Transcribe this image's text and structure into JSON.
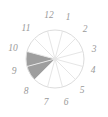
{
  "chart_data": {
    "type": "pie",
    "title": "",
    "subtitle": "",
    "xlabel": "",
    "ylabel": "",
    "legend_position": "none",
    "grid": false,
    "sector_count": 12,
    "sector_span_degrees": 30,
    "categories": [
      "1",
      "2",
      "3",
      "4",
      "5",
      "6",
      "7",
      "8",
      "9",
      "10",
      "11",
      "12"
    ],
    "values": [
      0,
      0,
      0,
      0,
      0,
      0,
      0,
      1,
      1,
      0,
      0,
      0
    ],
    "highlighted_sectors": [
      "8",
      "9"
    ],
    "shaded_arc_clock_range": "7:30 to 9:00",
    "shaded_arc_degrees": [
      240,
      300
    ],
    "colors": {
      "fill_shaded": "#9e9e9e",
      "fill_unshaded": "#ffffff",
      "outline": "#dcdcdc",
      "divider": "#e6e6e6",
      "label_text": "#9a9a9a",
      "background": "#ffffff"
    },
    "labels": [
      {
        "text": "12",
        "angle_deg": 90,
        "x": 49,
        "y": 16
      },
      {
        "text": "1",
        "angle_deg": 60,
        "x": 68,
        "y": 18
      },
      {
        "text": "2",
        "angle_deg": 30,
        "x": 85,
        "y": 30
      },
      {
        "text": "3",
        "angle_deg": 0,
        "x": 94,
        "y": 50
      },
      {
        "text": "4",
        "angle_deg": -30,
        "x": 93,
        "y": 71
      },
      {
        "text": "5",
        "angle_deg": -60,
        "x": 82,
        "y": 91
      },
      {
        "text": "6",
        "angle_deg": -90,
        "x": 66,
        "y": 103
      },
      {
        "text": "7",
        "angle_deg": -120,
        "x": 46,
        "y": 103
      },
      {
        "text": "8",
        "angle_deg": -150,
        "x": 26,
        "y": 92
      },
      {
        "text": "9",
        "angle_deg": 180,
        "x": 14,
        "y": 72
      },
      {
        "text": "10",
        "angle_deg": 150,
        "x": 13,
        "y": 49
      },
      {
        "text": "11",
        "angle_deg": 120,
        "x": 26,
        "y": 29
      }
    ],
    "geometry": {
      "center_x": 55,
      "center_y": 59,
      "radius": 29
    }
  }
}
